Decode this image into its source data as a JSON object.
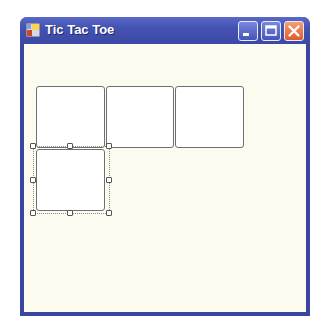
{
  "window": {
    "title": "Tic Tac Toe",
    "icon": "application-form-icon",
    "controls": {
      "minimize": "minimize-icon",
      "maximize": "maximize-icon",
      "close": "close-icon"
    }
  },
  "board": {
    "cells": [
      {
        "row": 0,
        "col": 0,
        "label": ""
      },
      {
        "row": 0,
        "col": 1,
        "label": ""
      },
      {
        "row": 0,
        "col": 2,
        "label": ""
      },
      {
        "row": 1,
        "col": 0,
        "label": "",
        "selected": true
      }
    ]
  },
  "colors": {
    "titlebar": "#4452b0",
    "client_background": "#fbfbef",
    "close_button": "#e05a28"
  }
}
